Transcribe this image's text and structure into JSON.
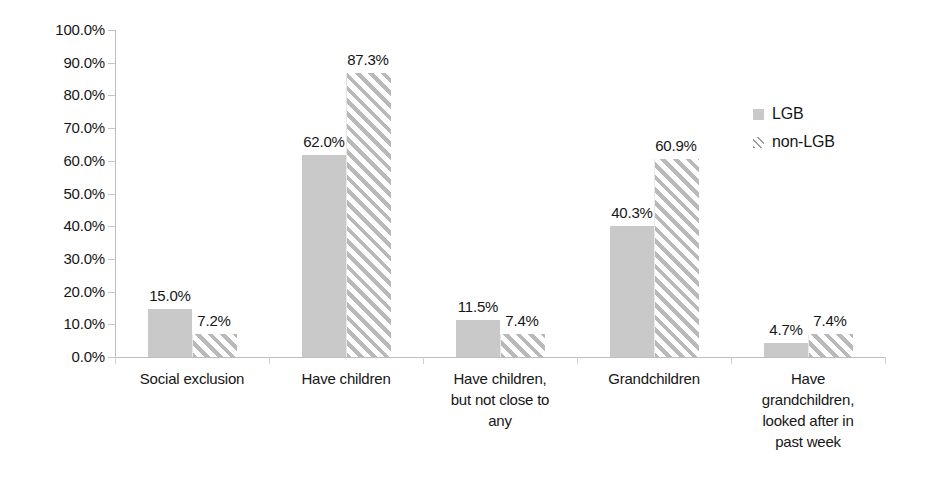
{
  "chart_data": {
    "type": "bar",
    "title": "",
    "xlabel": "",
    "ylabel": "",
    "ylim": [
      0,
      100
    ],
    "ytick_labels": [
      "100.0%",
      "90.0%",
      "80.0%",
      "70.0%",
      "60.0%",
      "50.0%",
      "40.0%",
      "30.0%",
      "20.0%",
      "10.0%",
      "0.0%"
    ],
    "ytick_values": [
      100,
      90,
      80,
      70,
      60,
      50,
      40,
      30,
      20,
      10,
      0
    ],
    "grid": false,
    "legend_position": "right",
    "value_suffix": "%",
    "categories": [
      "Social exclusion",
      "Have children",
      "Have children, but not close to any",
      "Grandchildren",
      "Have grandchildren, looked after in past week"
    ],
    "category_lines": [
      [
        "Social exclusion"
      ],
      [
        "Have children"
      ],
      [
        "Have children,",
        "but not close to",
        "any"
      ],
      [
        "Grandchildren"
      ],
      [
        "Have",
        "grandchildren,",
        "looked after in",
        "past week"
      ]
    ],
    "series": [
      {
        "name": "LGB",
        "fill": "solid",
        "color": "#c9c9c9",
        "values": [
          15.0,
          62.0,
          11.5,
          40.3,
          4.7
        ],
        "labels": [
          "15.0%",
          "62.0%",
          "11.5%",
          "40.3%",
          "4.7%"
        ]
      },
      {
        "name": "non-LGB",
        "fill": "diagonal-hatch",
        "color": "#b9b9b9",
        "values": [
          7.2,
          87.3,
          7.4,
          60.9,
          7.4
        ],
        "labels": [
          "7.2%",
          "87.3%",
          "7.4%",
          "60.9%",
          "7.4%"
        ]
      }
    ]
  },
  "legend": {
    "items": [
      {
        "label": "LGB",
        "fill": "solid"
      },
      {
        "label": "non-LGB",
        "fill": "diagonal-hatch"
      }
    ]
  },
  "axis": {
    "line_color": "#bdbdbd"
  }
}
